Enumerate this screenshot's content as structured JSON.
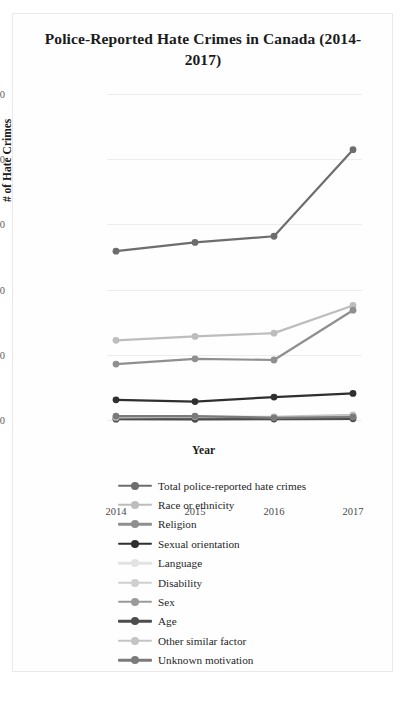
{
  "chart_data": {
    "type": "line",
    "title": "Police-Reported Hate Crimes in Canada (2014-2017)",
    "xlabel": "Year",
    "ylabel": "# of Hate Crimes",
    "categories": [
      "2014",
      "2015",
      "2016",
      "2017"
    ],
    "x_ticks": [
      "2014",
      "2015",
      "2016",
      "2017"
    ],
    "y_ticks": [
      "0",
      "500",
      "1,000",
      "1,500",
      "2,000",
      "2,500"
    ],
    "ylim": [
      0,
      2500
    ],
    "grid": "horizontal",
    "legend_position": "bottom",
    "series": [
      {
        "name": "Total police-reported hate crimes",
        "color": "#6d6d6d",
        "values": [
          1295,
          1362,
          1409,
          2073
        ]
      },
      {
        "name": "Race or ethnicity",
        "color": "#bdbdbd",
        "values": [
          611,
          641,
          666,
          878
        ]
      },
      {
        "name": "Religion",
        "color": "#8f8f8f",
        "values": [
          429,
          469,
          460,
          842
        ]
      },
      {
        "name": "Sexual orientation",
        "color": "#2f2f2f",
        "values": [
          155,
          141,
          176,
          204
        ]
      },
      {
        "name": "Language",
        "color": "#e3e3e3",
        "values": [
          23,
          12,
          21,
          30
        ]
      },
      {
        "name": "Disability",
        "color": "#cfcfcf",
        "values": [
          17,
          20,
          17,
          22
        ]
      },
      {
        "name": "Sex",
        "color": "#9a9a9a",
        "values": [
          14,
          18,
          21,
          26
        ]
      },
      {
        "name": "Age",
        "color": "#4d4d4d",
        "values": [
          6,
          5,
          7,
          9
        ]
      },
      {
        "name": "Other similar factor",
        "color": "#c4c4c4",
        "values": [
          20,
          26,
          24,
          39
        ]
      },
      {
        "name": "Unknown motivation",
        "color": "#7b7b7b",
        "values": [
          30,
          30,
          17,
          23
        ]
      }
    ]
  }
}
